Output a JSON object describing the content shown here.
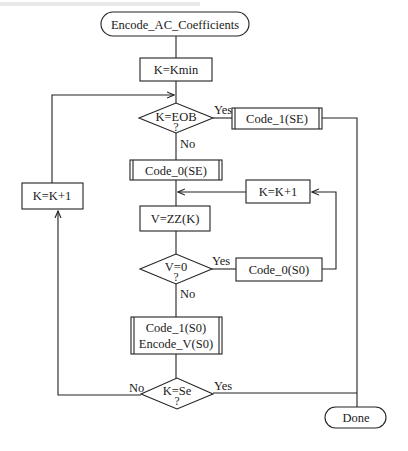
{
  "flowchart": {
    "start": {
      "label": "Encode_AC_Coefficients"
    },
    "init": {
      "label": "K=Kmin"
    },
    "decision_eob": {
      "label": "K=EOB",
      "q": "?",
      "yes": "Yes",
      "no": "No"
    },
    "code1_se": {
      "label": "Code_1(SE)"
    },
    "code0_se": {
      "label": "Code_0(SE)"
    },
    "inc_left": {
      "label": "K=K+1"
    },
    "inc_right": {
      "label": "K=K+1"
    },
    "vzz": {
      "label": "V=ZZ(K)"
    },
    "decision_v0": {
      "label": "V=0",
      "q": "?",
      "yes": "Yes",
      "no": "No"
    },
    "code0_s0": {
      "label": "Code_0(S0)"
    },
    "code1_s0": {
      "line1": "Code_1(S0)",
      "line2": "Encode_V(S0)"
    },
    "decision_se": {
      "label": "K=Se",
      "q": "?",
      "yes": "Yes",
      "no": "No"
    },
    "done": {
      "label": "Done"
    }
  },
  "colors": {
    "stroke": "#222222",
    "background": "#ffffff",
    "text": "#1a1a1a"
  }
}
